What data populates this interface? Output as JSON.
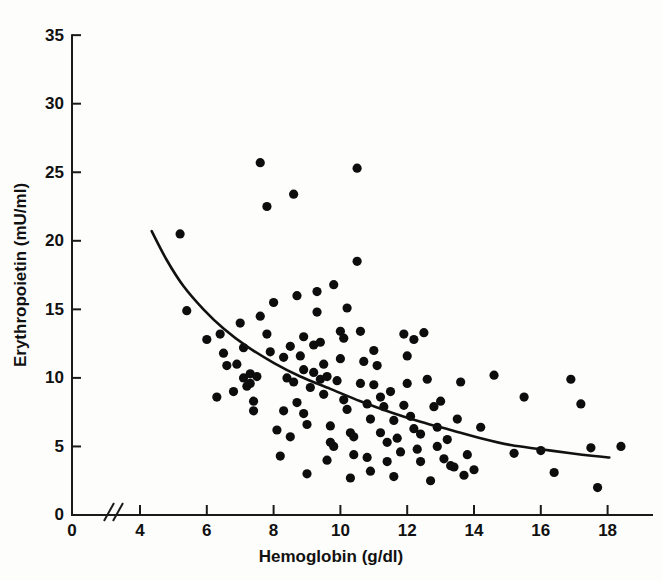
{
  "figure": {
    "title": "",
    "background": "#fdfdfc",
    "ink_color": "#111111"
  },
  "chart_data": {
    "type": "scatter",
    "title": "",
    "xlabel": "Hemoglobin (g/dl)",
    "ylabel": "Erythropoietin (mU/ml)",
    "xlim": [
      3.6,
      19.2
    ],
    "ylim": [
      0,
      36
    ],
    "xticks": [
      0,
      4,
      6,
      8,
      10,
      12,
      14,
      16,
      18
    ],
    "xticklabels": [
      "0",
      "4",
      "6",
      "8",
      "10",
      "12",
      "14",
      "16",
      "18"
    ],
    "yticks": [
      0,
      5,
      10,
      15,
      20,
      25,
      30,
      35
    ],
    "yticklabels": [
      "0",
      "5",
      "10",
      "15",
      "20",
      "25",
      "30",
      "35"
    ],
    "axis_break": {
      "present": true,
      "symbol": "//",
      "between": [
        0,
        4
      ]
    },
    "grid": false,
    "legend": null,
    "marker": {
      "shape": "circle",
      "size": 4.6,
      "color": "#0d0d0d"
    },
    "fit_curve": {
      "label": "regression curve",
      "style": "solid",
      "color": "#111111",
      "points": [
        [
          4.35,
          20.7
        ],
        [
          4.8,
          18.6
        ],
        [
          5.3,
          16.7
        ],
        [
          5.9,
          15.0
        ],
        [
          6.5,
          13.6
        ],
        [
          7.2,
          12.3
        ],
        [
          8.0,
          11.1
        ],
        [
          8.8,
          10.1
        ],
        [
          9.7,
          9.2
        ],
        [
          10.6,
          8.3
        ],
        [
          11.5,
          7.5
        ],
        [
          12.4,
          6.8
        ],
        [
          13.3,
          6.2
        ],
        [
          14.2,
          5.6
        ],
        [
          15.1,
          5.1
        ],
        [
          16.0,
          4.8
        ],
        [
          16.9,
          4.5
        ],
        [
          17.6,
          4.3
        ],
        [
          18.05,
          4.2
        ]
      ]
    },
    "points": [
      [
        5.2,
        20.5
      ],
      [
        5.4,
        14.9
      ],
      [
        6.0,
        12.8
      ],
      [
        6.4,
        13.2
      ],
      [
        6.5,
        11.8
      ],
      [
        6.6,
        10.9
      ],
      [
        6.9,
        11.0
      ],
      [
        7.1,
        10.0
      ],
      [
        7.2,
        9.4
      ],
      [
        7.3,
        10.3
      ],
      [
        7.3,
        9.6
      ],
      [
        7.4,
        8.3
      ],
      [
        7.5,
        10.1
      ],
      [
        7.1,
        12.2
      ],
      [
        7.4,
        7.6
      ],
      [
        7.6,
        25.7
      ],
      [
        7.8,
        22.5
      ],
      [
        7.6,
        14.5
      ],
      [
        7.8,
        13.2
      ],
      [
        7.9,
        11.9
      ],
      [
        8.0,
        15.5
      ],
      [
        8.3,
        11.5
      ],
      [
        8.4,
        10.0
      ],
      [
        8.2,
        4.3
      ],
      [
        8.3,
        7.6
      ],
      [
        8.6,
        23.4
      ],
      [
        8.7,
        16.0
      ],
      [
        8.5,
        12.3
      ],
      [
        8.6,
        9.7
      ],
      [
        8.7,
        8.2
      ],
      [
        8.8,
        11.6
      ],
      [
        8.9,
        10.6
      ],
      [
        8.9,
        7.4
      ],
      [
        9.0,
        6.6
      ],
      [
        9.0,
        3.0
      ],
      [
        9.1,
        9.3
      ],
      [
        9.2,
        10.4
      ],
      [
        9.3,
        16.3
      ],
      [
        9.2,
        12.4
      ],
      [
        9.4,
        9.9
      ],
      [
        9.5,
        11.0
      ],
      [
        9.5,
        8.8
      ],
      [
        9.6,
        10.1
      ],
      [
        9.7,
        6.5
      ],
      [
        9.7,
        5.3
      ],
      [
        9.8,
        5.0
      ],
      [
        9.9,
        9.8
      ],
      [
        10.0,
        13.4
      ],
      [
        10.1,
        12.9
      ],
      [
        10.0,
        11.4
      ],
      [
        10.1,
        8.4
      ],
      [
        10.2,
        7.7
      ],
      [
        10.3,
        6.0
      ],
      [
        10.4,
        4.4
      ],
      [
        10.4,
        5.7
      ],
      [
        10.5,
        25.3
      ],
      [
        10.5,
        18.5
      ],
      [
        10.6,
        13.4
      ],
      [
        10.7,
        11.2
      ],
      [
        10.6,
        9.6
      ],
      [
        10.8,
        8.1
      ],
      [
        10.9,
        7.0
      ],
      [
        10.8,
        4.2
      ],
      [
        11.0,
        12.0
      ],
      [
        11.0,
        9.5
      ],
      [
        11.1,
        10.9
      ],
      [
        11.2,
        8.6
      ],
      [
        11.3,
        7.9
      ],
      [
        11.2,
        6.0
      ],
      [
        11.4,
        5.3
      ],
      [
        11.4,
        3.9
      ],
      [
        11.5,
        9.0
      ],
      [
        11.6,
        6.9
      ],
      [
        11.7,
        5.6
      ],
      [
        11.8,
        4.6
      ],
      [
        11.9,
        8.0
      ],
      [
        12.0,
        11.6
      ],
      [
        12.0,
        9.6
      ],
      [
        12.1,
        7.2
      ],
      [
        12.2,
        6.3
      ],
      [
        12.3,
        4.8
      ],
      [
        12.4,
        5.9
      ],
      [
        12.5,
        13.3
      ],
      [
        12.6,
        9.9
      ],
      [
        12.7,
        2.5
      ],
      [
        12.8,
        7.9
      ],
      [
        12.9,
        6.4
      ],
      [
        12.9,
        5.0
      ],
      [
        13.0,
        8.3
      ],
      [
        13.1,
        4.1
      ],
      [
        13.2,
        5.5
      ],
      [
        13.3,
        3.6
      ],
      [
        13.4,
        3.5
      ],
      [
        13.5,
        7.0
      ],
      [
        13.6,
        9.7
      ],
      [
        13.8,
        4.4
      ],
      [
        14.0,
        3.3
      ],
      [
        14.2,
        6.4
      ],
      [
        14.6,
        10.2
      ],
      [
        15.2,
        4.5
      ],
      [
        15.5,
        8.6
      ],
      [
        16.0,
        4.7
      ],
      [
        16.4,
        3.1
      ],
      [
        16.9,
        9.9
      ],
      [
        17.2,
        8.1
      ],
      [
        17.5,
        4.9
      ],
      [
        17.7,
        2.0
      ],
      [
        18.4,
        5.0
      ],
      [
        12.2,
        12.8
      ],
      [
        11.9,
        13.2
      ],
      [
        9.4,
        12.6
      ],
      [
        8.9,
        13.0
      ],
      [
        9.3,
        14.8
      ],
      [
        10.2,
        15.1
      ],
      [
        9.8,
        16.8
      ],
      [
        7.0,
        14.0
      ],
      [
        6.8,
        9.0
      ],
      [
        6.3,
        8.6
      ],
      [
        8.1,
        6.2
      ],
      [
        8.5,
        5.7
      ],
      [
        9.6,
        4.0
      ],
      [
        10.9,
        3.2
      ],
      [
        12.4,
        3.9
      ],
      [
        13.7,
        2.9
      ],
      [
        11.6,
        2.8
      ],
      [
        10.3,
        2.7
      ]
    ]
  },
  "axis_titles": {
    "x": "Hemoglobin (g/dl)",
    "y": "Erythropoietin (mU/ml)"
  }
}
